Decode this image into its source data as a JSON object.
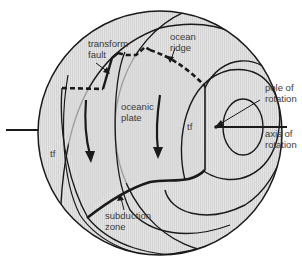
{
  "diagram": {
    "colors": {
      "sphere_fill": "#e2e2e2",
      "plate_fill": "#d6d6d6",
      "stroke": "#1a1a1a",
      "text": "#3a3a3a"
    },
    "labels": {
      "transform_fault": [
        "transform",
        "fault"
      ],
      "ocean_ridge": [
        "ocean",
        "ridge"
      ],
      "pole_of_rotation": [
        "pole of",
        "rotation"
      ],
      "oceanic_plate": [
        "oceanic",
        "plate"
      ],
      "axis_of_rotation": [
        "axis of",
        "rotation"
      ],
      "tf_left": "tf",
      "tf_right": "tf",
      "subduction_zone": [
        "subduction",
        "zone"
      ]
    }
  }
}
